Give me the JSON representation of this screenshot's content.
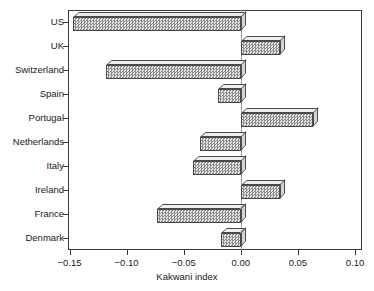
{
  "chart_data": {
    "type": "bar",
    "orientation": "horizontal",
    "title": "",
    "subtitle": "",
    "xlabel": "Kakwani index",
    "ylabel": "",
    "categories": [
      "US",
      "UK",
      "Switzerland",
      "Spain",
      "Portugal",
      "Netherlands",
      "Italy",
      "Ireland",
      "France",
      "Denmark"
    ],
    "values": [
      -0.147,
      0.034,
      -0.118,
      -0.02,
      0.063,
      -0.036,
      -0.042,
      0.034,
      -0.073,
      -0.017
    ],
    "series": [
      {
        "name": "Kakwani index",
        "values": [
          -0.147,
          0.034,
          -0.118,
          -0.02,
          0.063,
          -0.036,
          -0.042,
          0.034,
          -0.073,
          -0.017
        ]
      }
    ],
    "xlim": [
      -0.15,
      0.1
    ],
    "xticks": [
      -0.15,
      -0.1,
      -0.05,
      0.0,
      0.05,
      0.1
    ],
    "xticklabels": [
      "-0.15",
      "-0.10",
      "-0.05",
      "0.00",
      "0.05",
      "0.10"
    ],
    "grid": false,
    "legend": false,
    "legend_position": "none",
    "bar_style": "3d-hatched",
    "colors": {
      "bar_face": "#c9c9c9",
      "bar_top": "#ededed",
      "bar_side": "#d6d6d6",
      "bar_edge": "#4a4a4a",
      "axis": "#3a3a3a",
      "text": "#1a1a1a",
      "background": "#ffffff"
    }
  },
  "axes": {
    "x_title": "Kakwani index",
    "tick_labels_x": [
      "-0.15",
      "-0.10",
      "-0.05",
      "0.00",
      "0.05",
      "0.10"
    ],
    "tick_labels_y": [
      "US",
      "UK",
      "Switzerland",
      "Spain",
      "Portugal",
      "Netherlands",
      "Italy",
      "Ireland",
      "France",
      "Denmark"
    ]
  }
}
